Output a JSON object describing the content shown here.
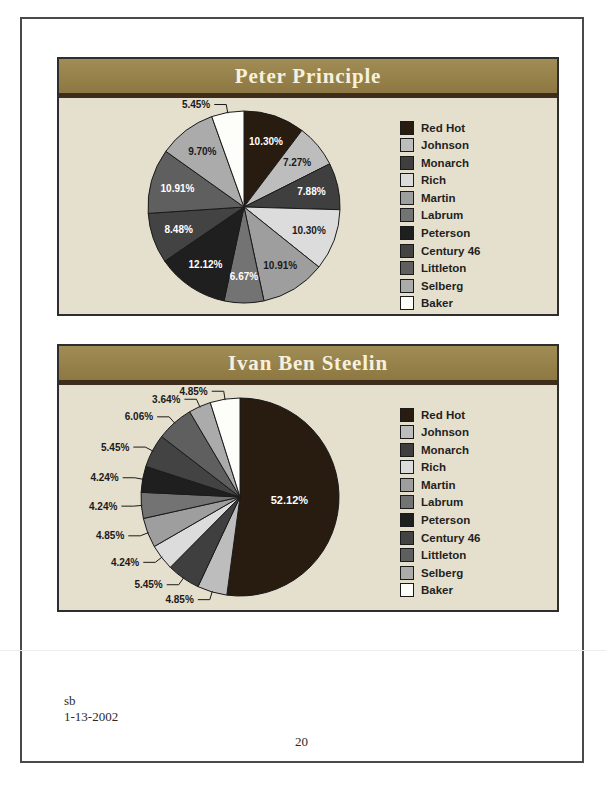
{
  "chart_data": [
    {
      "type": "pie",
      "title": "Peter Principle",
      "categories": [
        "Red Hot",
        "Johnson",
        "Monarch",
        "Rich",
        "Martin",
        "Labrum",
        "Peterson",
        "Century 46",
        "Littleton",
        "Selberg",
        "Baker"
      ],
      "values": [
        10.3,
        7.27,
        7.88,
        10.3,
        10.91,
        6.67,
        12.12,
        8.48,
        10.91,
        9.7,
        5.45
      ],
      "labels": [
        "10.30%",
        "7.27%",
        "7.88%",
        "10.30%",
        "10.91%",
        "6.67%",
        "12.12%",
        "8.48%",
        "10.91%",
        "9.70%",
        "5.45%"
      ],
      "colors": [
        "#281b10",
        "#bdbdbd",
        "#3f3f3f",
        "#dcdcdc",
        "#9e9e9e",
        "#737373",
        "#1f1f1f",
        "#434343",
        "#5f5f5f",
        "#ababab",
        "#fdfdfa"
      ],
      "outside_labels": [
        "Baker"
      ],
      "start_angle": 0,
      "direction": "clockwise",
      "legend_position": "right",
      "panel_colors": {
        "header": "#98834c",
        "divider": "#3e2d1a",
        "body": "#e5dfcd",
        "title_text": "#f6f1de"
      }
    },
    {
      "type": "pie",
      "title": "Ivan Ben Steelin",
      "categories": [
        "Red Hot",
        "Johnson",
        "Monarch",
        "Rich",
        "Martin",
        "Labrum",
        "Peterson",
        "Century 46",
        "Littleton",
        "Selberg",
        "Baker"
      ],
      "values": [
        52.12,
        4.85,
        5.45,
        4.24,
        4.85,
        4.24,
        4.24,
        5.45,
        6.06,
        3.64,
        4.85
      ],
      "labels": [
        "52.12%",
        "4.85%",
        "5.45%",
        "4.24%",
        "4.85%",
        "4.24%",
        "4.24%",
        "5.45%",
        "6.06%",
        "3.64%",
        "4.85%"
      ],
      "colors": [
        "#281b10",
        "#bdbdbd",
        "#3f3f3f",
        "#dcdcdc",
        "#9e9e9e",
        "#737373",
        "#1f1f1f",
        "#434343",
        "#5f5f5f",
        "#ababab",
        "#fdfdfa"
      ],
      "outside_labels": [
        "Johnson",
        "Monarch",
        "Rich",
        "Martin",
        "Labrum",
        "Peterson",
        "Century 46",
        "Littleton",
        "Selberg",
        "Baker"
      ],
      "start_angle": 0,
      "direction": "clockwise",
      "legend_position": "right",
      "panel_colors": {
        "header": "#98834c",
        "divider": "#3e2d1a",
        "body": "#e5dfcd",
        "title_text": "#f6f1de"
      }
    }
  ],
  "footer": {
    "author": "sb",
    "date": "1-13-2002",
    "page_number": "20"
  }
}
